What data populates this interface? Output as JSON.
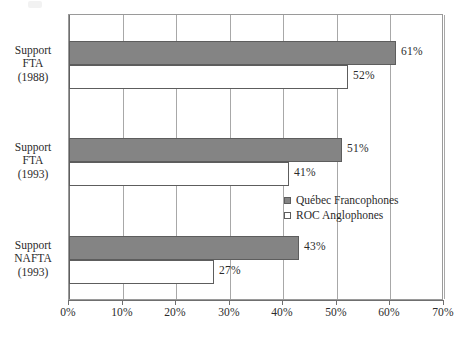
{
  "chart_data": {
    "type": "bar",
    "orientation": "horizontal",
    "title": "",
    "xlabel": "",
    "ylabel": "",
    "xlim": [
      0,
      70
    ],
    "xtick_labels": [
      "0%",
      "10%",
      "20%",
      "30%",
      "40%",
      "50%",
      "60%",
      "70%"
    ],
    "xticks": [
      0,
      10,
      20,
      30,
      40,
      50,
      60,
      70
    ],
    "grid": true,
    "legend_position": "inside-right-middle",
    "categories": [
      "Support FTA (1988)",
      "Support FTA (1993)",
      "Support NAFTA (1993)"
    ],
    "category_label_lines": [
      [
        "Support",
        "FTA",
        "(1988)"
      ],
      [
        "Support",
        "FTA",
        "(1993)"
      ],
      [
        "Support",
        "NAFTA",
        "(1993)"
      ]
    ],
    "series": [
      {
        "name": "Québec Francophones",
        "color": "#848484",
        "values": [
          61,
          51,
          43
        ],
        "value_labels": [
          "61%",
          "51%",
          "43%"
        ]
      },
      {
        "name": "ROC Anglophones",
        "color": "#ffffff",
        "values": [
          52,
          41,
          27
        ],
        "value_labels": [
          "52%",
          "41%",
          "27%"
        ]
      }
    ]
  },
  "legend": {
    "items": [
      {
        "label": "Québec Francophones",
        "swatch": "filled-gray-square"
      },
      {
        "label": "ROC Anglophones",
        "swatch": "hollow-white-square"
      }
    ]
  },
  "colors": {
    "series_filled": "#848484",
    "series_hollow": "#ffffff",
    "bar_border": "#5d5d5d",
    "gridline": "#a8a8a8",
    "axis": "#6f6f6f",
    "text": "#2b2b2b",
    "background": "#ffffff"
  }
}
